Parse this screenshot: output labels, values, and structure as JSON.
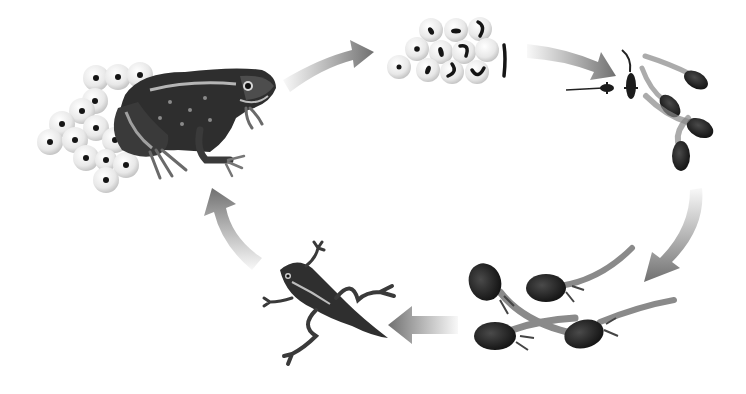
{
  "diagram": {
    "type": "cycle",
    "direction": "clockwise",
    "background": "#ffffff",
    "stages": [
      {
        "id": "adult-frog",
        "name": "Adult frog with egg mass",
        "x": 165,
        "y": 125
      },
      {
        "id": "frogspawn",
        "name": "Frogspawn (developing embryos)",
        "x": 445,
        "y": 50
      },
      {
        "id": "tadpoles-young",
        "name": "Young tadpoles",
        "x": 640,
        "y": 110
      },
      {
        "id": "tadpoles-legs",
        "name": "Tadpoles with hind legs",
        "x": 565,
        "y": 305
      },
      {
        "id": "froglet",
        "name": "Froglet with tail",
        "x": 320,
        "y": 305
      }
    ],
    "arrows": [
      {
        "from": "adult-frog",
        "to": "frogspawn"
      },
      {
        "from": "frogspawn",
        "to": "tadpoles-young"
      },
      {
        "from": "tadpoles-young",
        "to": "tadpoles-legs"
      },
      {
        "from": "tadpoles-legs",
        "to": "froglet"
      },
      {
        "from": "froglet",
        "to": "adult-frog"
      }
    ],
    "colors": {
      "arrow": "#7a7a7a",
      "egg": "#ececec",
      "egg_edge": "#c8c8c8",
      "embryo": "#151515",
      "frog_dark": "#2b2b2b",
      "frog_mid": "#5a5a5a",
      "frog_light": "#a8a8a8",
      "tadpole_body": "#2a2a2a",
      "tadpole_tail": "#8a8a8a"
    }
  }
}
